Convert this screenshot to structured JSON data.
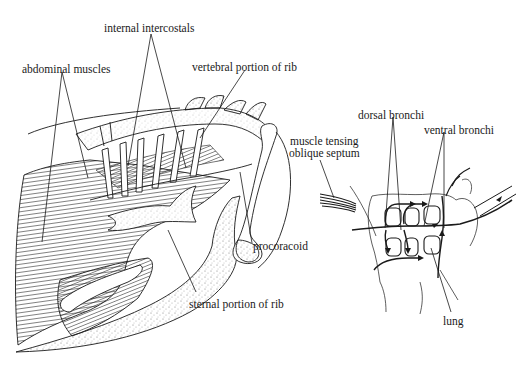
{
  "figure": {
    "left_panel": {
      "subject": "avian rib cage and abdominal musculature (lateral view)",
      "labels": [
        {
          "id": "abdominal-muscles",
          "text": "abdominal muscles",
          "x": 22,
          "y": 63
        },
        {
          "id": "internal-intercostals",
          "text": "internal intercostals",
          "x": 104,
          "y": 22
        },
        {
          "id": "vertebral-portion-of-rib",
          "text": "vertebral portion of rib",
          "x": 192,
          "y": 61
        },
        {
          "id": "procoracoid",
          "text": "procoracoid",
          "x": 253,
          "y": 240
        },
        {
          "id": "sternal-portion-of-rib",
          "text": "sternal portion of rib",
          "x": 189,
          "y": 298
        }
      ]
    },
    "right_panel": {
      "subject": "avian lung airflow through bronchi",
      "labels": [
        {
          "id": "dorsal-bronchi",
          "text": "dorsal bronchi",
          "x": 358,
          "y": 109
        },
        {
          "id": "ventral-bronchi",
          "text": "ventral bronchi",
          "x": 424,
          "y": 124
        },
        {
          "id": "muscle-tensing-oblique-septum",
          "line1": "muscle tensing",
          "line2": "oblique septum",
          "x": 291,
          "y": 135
        },
        {
          "id": "lung",
          "text": "lung",
          "x": 443,
          "y": 315
        }
      ]
    },
    "colors": {
      "ink": "#1a1a1a",
      "background": "#ffffff",
      "stipple": "#8a8a8a"
    }
  }
}
